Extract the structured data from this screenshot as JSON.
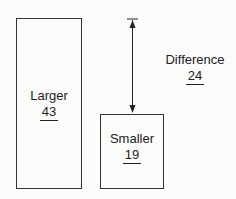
{
  "diagram": {
    "larger": {
      "label": "Larger",
      "value": "43"
    },
    "smaller": {
      "label": "Smaller",
      "value": "19"
    },
    "difference": {
      "label": "Difference",
      "value": "24"
    }
  }
}
